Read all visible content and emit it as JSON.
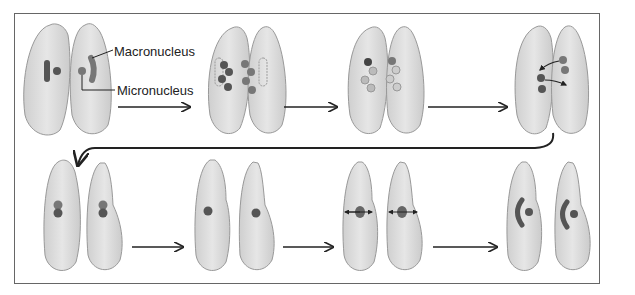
{
  "diagram": {
    "labels": {
      "macronucleus": "Macronucleus",
      "micronucleus": "Micronucleus"
    },
    "colors": {
      "cell_fill": "#dedede",
      "cell_stroke": "#9a9a9a",
      "nucleus_dark": "#555555",
      "nucleus_mid": "#6e6e6e",
      "nucleus_light": "#a8a8a8",
      "arrow": "#222222",
      "frame": "#666666"
    },
    "stages": [
      {
        "row": 1,
        "index": 1,
        "description": "Two cells pair; each with macronucleus and micronucleus"
      },
      {
        "row": 1,
        "index": 2,
        "description": "Micronuclei divide by meiosis; macronucleus disintegrates"
      },
      {
        "row": 1,
        "index": 3,
        "description": "Three micronuclei disintegrate; remaining divides"
      },
      {
        "row": 1,
        "index": 4,
        "description": "Micronuclei exchanged between cells"
      },
      {
        "row": 2,
        "index": 5,
        "description": "Cells separate; micronuclei fuse"
      },
      {
        "row": 2,
        "index": 6,
        "description": "Single diploid micronucleus"
      },
      {
        "row": 2,
        "index": 7,
        "description": "Micronucleus divides"
      },
      {
        "row": 2,
        "index": 8,
        "description": "Macronucleus and micronucleus restored"
      }
    ]
  }
}
